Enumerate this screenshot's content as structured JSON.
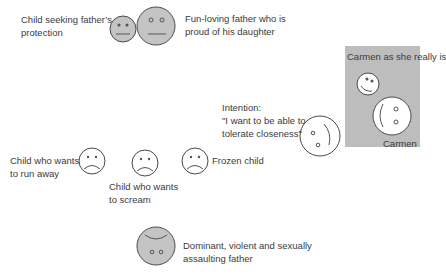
{
  "diagram": {
    "colors": {
      "face_fill_gray": "#c4c4c4",
      "face_fill_white": "#ffffff",
      "outline": "#4a4a4a",
      "box_fill": "#bdbdbd",
      "text": "#3b3b3b"
    },
    "labels": {
      "child_seeking": "Child seeking father’s\nprotection",
      "fun_loving_father": "Fun-loving father who is\nproud of his daughter",
      "carmen_really": "Carmen as she really is",
      "carmen": "Carmen",
      "intention": "Intention:\n\"I want to be able to\ntolerate closeness\"",
      "run_away": "Child who wants\nto run away",
      "scream": "Child who wants\nto scream",
      "frozen": "Frozen child",
      "dominant_father": "Dominant, violent and sexually\nassaulting father"
    },
    "faces": [
      {
        "id": "child-seeking-protection",
        "expression": "neutral",
        "fill": "gray"
      },
      {
        "id": "fun-loving-father",
        "expression": "neutral",
        "fill": "gray"
      },
      {
        "id": "carmen-as-she-really-is",
        "expression": "smiling",
        "fill": "white"
      },
      {
        "id": "carmen",
        "expression": "side-profile",
        "fill": "white"
      },
      {
        "id": "intention",
        "expression": "side-profile",
        "fill": "white"
      },
      {
        "id": "child-run-away",
        "expression": "sad",
        "fill": "white"
      },
      {
        "id": "child-scream",
        "expression": "sad",
        "fill": "white"
      },
      {
        "id": "frozen-child",
        "expression": "sad",
        "fill": "white"
      },
      {
        "id": "dominant-father",
        "expression": "inverted",
        "fill": "gray"
      }
    ]
  }
}
